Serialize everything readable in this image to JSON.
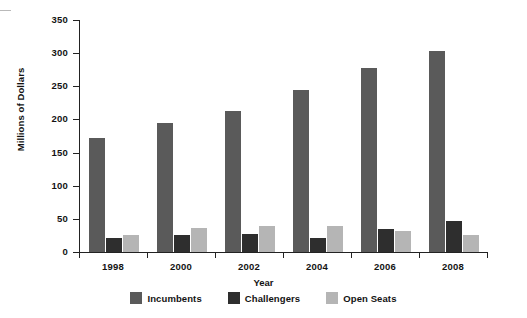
{
  "chart_data": {
    "type": "bar",
    "title": "",
    "xlabel": "Year",
    "ylabel": "Millions of Dollars",
    "categories": [
      "1998",
      "2000",
      "2002",
      "2004",
      "2006",
      "2008"
    ],
    "series": [
      {
        "name": "Incumbents",
        "color": "#5a5a5a",
        "values": [
          172,
          194,
          213,
          245,
          277,
          303
        ]
      },
      {
        "name": "Challengers",
        "color": "#2e2e2e",
        "values": [
          21,
          25,
          27,
          21,
          35,
          47
        ]
      },
      {
        "name": "Open Seats",
        "color": "#b5b5b5",
        "values": [
          26,
          36,
          39,
          40,
          31,
          26
        ]
      }
    ],
    "ylim": [
      0,
      350
    ],
    "ytick_step": 50,
    "yticks": [
      "0",
      "50",
      "100",
      "150",
      "200",
      "250",
      "300",
      "350"
    ],
    "grid": false,
    "legend_position": "bottom",
    "legend_entries": [
      "Incumbents",
      "Challengers",
      "Open Seats"
    ],
    "axis_color": "#222222",
    "background_color": "#ffffff"
  }
}
